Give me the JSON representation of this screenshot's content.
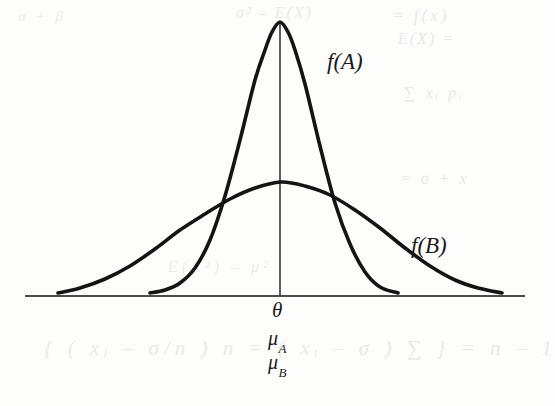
{
  "figure": {
    "background_color": "#fdfdfc",
    "ink_color": "#141414",
    "axis_color": "#4c4c4c"
  },
  "labels": {
    "curve_a": "f(A)",
    "curve_b": "f(B)",
    "center_tick": "θ",
    "mu_a_base": "μ",
    "mu_a_sub": "A",
    "mu_b_base": "μ",
    "mu_b_sub": "B"
  },
  "bleed_through": {
    "top_left": "α + β",
    "top_center": "σ² – E(X)",
    "top_right": "= f(x)",
    "top_right_2": "E(X) =",
    "mid_right": "∑ xᵢ pᵢ",
    "mid_right_2": "= σ + x",
    "mid_left": "E(X²) – μ²",
    "bottom": "{ ( xᵢ – σ/n ) n = ( xᵢ – σ ) ∑ } = n – 1"
  },
  "chart_data": {
    "type": "line",
    "xlabel": "",
    "ylabel": "",
    "grid": false,
    "legend": "inline-annotations",
    "axis": {
      "baseline_y_px": 296,
      "x_start_px": 25,
      "x_end_px": 525,
      "center_x_px": 280
    },
    "annotations": [
      {
        "text": "f(A)",
        "x_px": 327,
        "y_px": 49,
        "describes": "narrow high-peaked curve"
      },
      {
        "text": "f(B)",
        "x_px": 411,
        "y_px": 233,
        "describes": "wide low-peaked curve"
      },
      {
        "text": "θ",
        "x_px": 272,
        "y_px": 298,
        "describes": "true parameter value on x-axis"
      },
      {
        "text": "μ_A",
        "x_px": 268,
        "y_px": 327,
        "describes": "mean of estimator A"
      },
      {
        "text": "μ_B",
        "x_px": 268,
        "y_px": 351,
        "describes": "mean of estimator B"
      }
    ],
    "series": [
      {
        "name": "f(A)",
        "description": "Normal density, mean theta, small variance, tall narrow peak",
        "mean_px": 280,
        "peak_y_px": 22,
        "peak_height_px": 274,
        "sigma_px": 44,
        "left_tail_end_px": 150,
        "right_tail_end_px": 398,
        "x": [
          150,
          165,
          180,
          195,
          210,
          225,
          240,
          255,
          265,
          272,
          280,
          288,
          295,
          305,
          320,
          335,
          350,
          365,
          380,
          398
        ],
        "y": [
          293,
          290,
          283,
          268,
          240,
          196,
          140,
          80,
          50,
          32,
          22,
          32,
          50,
          84,
          146,
          203,
          244,
          272,
          287,
          293
        ]
      },
      {
        "name": "f(B)",
        "description": "Normal density, mean theta, large variance, low wide curve",
        "mean_px": 281,
        "peak_y_px": 182,
        "peak_height_px": 114,
        "sigma_px": 100,
        "left_tail_end_px": 58,
        "right_tail_end_px": 502,
        "x": [
          58,
          80,
          105,
          130,
          155,
          180,
          205,
          230,
          255,
          281,
          305,
          330,
          355,
          380,
          405,
          430,
          455,
          478,
          502
        ],
        "y": [
          293,
          288,
          279,
          266,
          249,
          230,
          214,
          199,
          188,
          182,
          186,
          195,
          210,
          228,
          248,
          266,
          280,
          288,
          293
        ]
      }
    ],
    "vertical_reference_line": {
      "x_px": 280,
      "from_y_px": 22,
      "to_y_px": 296,
      "meaning": "center at theta = mu_A = mu_B"
    },
    "interpretation": "Both estimators are unbiased (both centred on θ), but A has smaller variance than B, so f(A) is taller and narrower."
  }
}
